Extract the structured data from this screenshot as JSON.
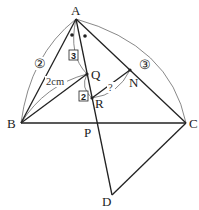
{
  "diagram": {
    "type": "geometry",
    "points": {
      "A": "A",
      "B": "B",
      "C": "C",
      "P": "P",
      "Q": "Q",
      "R": "R",
      "N": "N",
      "D": "D"
    },
    "segments": [
      "AB",
      "AC",
      "BC",
      "AD (through Q, R, P)",
      "BQ",
      "RN",
      "CD"
    ],
    "angle_marks": "two dots marking equal angles at A (AP bisects angle BAC)",
    "labels": {
      "ratio_AB": "②",
      "ratio_AC": "③",
      "length_BQ": "2cm",
      "ratio_AQ": "3",
      "ratio_QR": "2",
      "unknown_RN": "?"
    }
  }
}
